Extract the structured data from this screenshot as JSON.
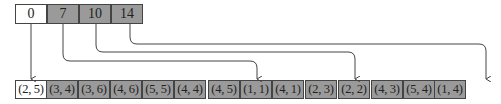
{
  "offsets": {
    "label": "offset array",
    "cells": [
      {
        "value": "0",
        "highlighted": false,
        "target_index": 0
      },
      {
        "value": "7",
        "highlighted": true,
        "target_index": 7
      },
      {
        "value": "10",
        "highlighted": true,
        "target_index": 10
      },
      {
        "value": "14",
        "highlighted": true,
        "target_index": 14
      }
    ]
  },
  "pairs": {
    "label": "pair array",
    "cells": [
      {
        "value": "(2, 5)",
        "highlighted": false
      },
      {
        "value": "(3, 4)",
        "highlighted": true
      },
      {
        "value": "(3, 6)",
        "highlighted": true
      },
      {
        "value": "(4, 6)",
        "highlighted": true
      },
      {
        "value": "(5, 5)",
        "highlighted": true
      },
      {
        "value": "(4, 4)",
        "highlighted": true
      },
      {
        "value": "(4, 5)",
        "highlighted": true
      },
      {
        "value": "(1, 1)",
        "highlighted": true
      },
      {
        "value": "(4, 1)",
        "highlighted": true
      },
      {
        "value": "(2, 3)",
        "highlighted": true
      },
      {
        "value": "(2, 2)",
        "highlighted": true
      },
      {
        "value": "(4, 3)",
        "highlighted": true
      },
      {
        "value": "(5, 4)",
        "highlighted": true
      },
      {
        "value": "(1, 4)",
        "highlighted": true
      }
    ]
  },
  "colors": {
    "shaded": "#9a9a9a",
    "border": "#444444",
    "arrow": "#444444",
    "background": "#ffffff"
  }
}
